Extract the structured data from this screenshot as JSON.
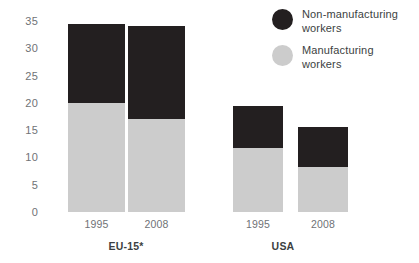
{
  "chart_data": {
    "type": "bar",
    "stacked": true,
    "title": "",
    "subtitle": "",
    "xlabel": "",
    "ylabel": "",
    "ylim": [
      0,
      35
    ],
    "yticks": [
      0,
      5,
      10,
      15,
      20,
      25,
      30,
      35
    ],
    "ytick_labels": [
      "0",
      "5",
      "10",
      "15",
      "20",
      "25",
      "30",
      "35"
    ],
    "grid": false,
    "legend_position": "top-right",
    "categories": [
      "1995",
      "2008",
      "1995",
      "2008"
    ],
    "groups": [
      {
        "name": "EU-15*",
        "categories": [
          "1995",
          "2008"
        ]
      },
      {
        "name": "USA",
        "categories": [
          "1995",
          "2008"
        ]
      }
    ],
    "series": [
      {
        "name": "Manufacturing workers",
        "color": "#cccccc",
        "values": [
          20.0,
          17.1,
          11.8,
          8.3
        ]
      },
      {
        "name": "Non-manufacturing workers",
        "color": "#231f20",
        "values": [
          14.5,
          16.9,
          7.7,
          7.3
        ]
      }
    ],
    "totals": [
      34.5,
      34.0,
      19.5,
      15.6
    ]
  },
  "y_axis": {
    "ticks": [
      {
        "label": "35",
        "value": 35
      },
      {
        "label": "30",
        "value": 30
      },
      {
        "label": "25",
        "value": 25
      },
      {
        "label": "20",
        "value": 20
      },
      {
        "label": "15",
        "value": 15
      },
      {
        "label": "10",
        "value": 10
      },
      {
        "label": "5",
        "value": 5
      },
      {
        "label": "0",
        "value": 0
      }
    ]
  },
  "bars": [
    {
      "group": "EU-15*",
      "category": "1995",
      "manufacturing": 20.0,
      "non_manufacturing": 14.5,
      "total": 34.5,
      "left": 20,
      "width": 57
    },
    {
      "group": "EU-15*",
      "category": "2008",
      "manufacturing": 17.1,
      "non_manufacturing": 16.9,
      "total": 34.0,
      "left": 80,
      "width": 57
    },
    {
      "group": "USA",
      "category": "1995",
      "manufacturing": 11.8,
      "non_manufacturing": 7.7,
      "total": 19.5,
      "left": 185,
      "width": 50
    },
    {
      "group": "USA",
      "category": "2008",
      "manufacturing": 8.3,
      "non_manufacturing": 7.3,
      "total": 15.6,
      "left": 250,
      "width": 50
    }
  ],
  "group_labels": [
    {
      "text": "EU-15*",
      "center": 78
    },
    {
      "text": "USA",
      "center": 235
    }
  ],
  "legend": {
    "items": [
      {
        "label_line1": "Non-manufacturing",
        "label_line2": "workers",
        "color": "#231f20"
      },
      {
        "label_line1": "Manufacturing",
        "label_line2": "workers",
        "color": "#cccccc"
      }
    ]
  },
  "colors": {
    "non_manufacturing": "#231f20",
    "manufacturing": "#cccccc",
    "tick_text": "#6f7276",
    "label_text": "#3c3f42",
    "background": "#ffffff"
  }
}
